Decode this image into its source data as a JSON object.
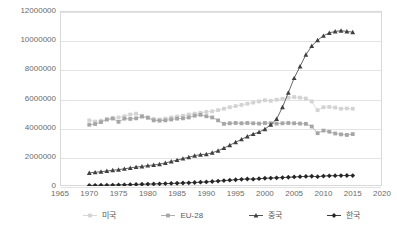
{
  "chart_data": {
    "type": "line",
    "title": "",
    "subtitle": "",
    "xlabel": "",
    "ylabel": "",
    "xlim": [
      1965,
      2020
    ],
    "ylim": [
      0,
      12000000
    ],
    "xticks": [
      1965,
      1970,
      1975,
      1980,
      1985,
      1990,
      1995,
      2000,
      2005,
      2010,
      2015,
      2020
    ],
    "yticks": [
      0,
      2000000,
      4000000,
      6000000,
      8000000,
      10000000,
      12000000
    ],
    "ytick_labels": [
      "0",
      "2000000",
      "4000000",
      "6000000",
      "8000000",
      "10000000",
      "12000000"
    ],
    "grid": "horizontal",
    "legend_position": "bottom",
    "x": [
      1970,
      1971,
      1972,
      1973,
      1974,
      1975,
      1976,
      1977,
      1978,
      1979,
      1980,
      1981,
      1982,
      1983,
      1984,
      1985,
      1986,
      1987,
      1988,
      1989,
      1990,
      1991,
      1992,
      1993,
      1994,
      1995,
      1996,
      1997,
      1998,
      1999,
      2000,
      2001,
      2002,
      2003,
      2004,
      2005,
      2006,
      2007,
      2008,
      2009,
      2010,
      2011,
      2012,
      2013,
      2014,
      2015
    ],
    "series": [
      {
        "name": "미국",
        "marker": "square",
        "color": "#d3d3d3",
        "values": [
          4500000,
          4420000,
          4480000,
          4560000,
          4620000,
          4700000,
          4780000,
          4900000,
          4960000,
          4820000,
          4700000,
          4600000,
          4560000,
          4620000,
          4700000,
          4760000,
          4820000,
          4900000,
          4960000,
          5020000,
          5080000,
          5120000,
          5200000,
          5300000,
          5400000,
          5480000,
          5560000,
          5640000,
          5720000,
          5800000,
          5880000,
          5840000,
          5920000,
          5980000,
          6050000,
          6100000,
          6060000,
          6000000,
          5800000,
          5200000,
          5400000,
          5420000,
          5380000,
          5300000,
          5320000,
          5300000
        ]
      },
      {
        "name": "EU-28",
        "marker": "square",
        "color": "#a6a6a6",
        "values": [
          4200000,
          4250000,
          4380000,
          4560000,
          4640000,
          4400000,
          4620000,
          4600000,
          4640000,
          4760000,
          4680000,
          4500000,
          4480000,
          4500000,
          4560000,
          4620000,
          4640000,
          4700000,
          4820000,
          4880000,
          4780000,
          4700000,
          4500000,
          4260000,
          4300000,
          4320000,
          4300000,
          4320000,
          4300000,
          4280000,
          4320000,
          4300000,
          4280000,
          4300000,
          4320000,
          4300000,
          4280000,
          4260000,
          4080000,
          3620000,
          3800000,
          3720000,
          3600000,
          3540000,
          3500000,
          3560000
        ]
      },
      {
        "name": "중국",
        "marker": "triangle",
        "color": "#404040",
        "values": [
          900000,
          940000,
          980000,
          1030000,
          1080000,
          1120000,
          1180000,
          1240000,
          1300000,
          1340000,
          1400000,
          1440000,
          1500000,
          1580000,
          1680000,
          1780000,
          1880000,
          1980000,
          2080000,
          2150000,
          2180000,
          2280000,
          2420000,
          2600000,
          2800000,
          3000000,
          3200000,
          3400000,
          3560000,
          3700000,
          3900000,
          4200000,
          4600000,
          5400000,
          6400000,
          7400000,
          8200000,
          9000000,
          9600000,
          10000000,
          10300000,
          10500000,
          10600000,
          10650000,
          10600000,
          10550000
        ]
      },
      {
        "name": "한국",
        "marker": "diamond",
        "color": "#262626",
        "values": [
          40000,
          45000,
          50000,
          58000,
          66000,
          74000,
          84000,
          96000,
          110000,
          120000,
          130000,
          140000,
          152000,
          164000,
          178000,
          190000,
          205000,
          220000,
          240000,
          260000,
          280000,
          310000,
          340000,
          370000,
          400000,
          430000,
          460000,
          480000,
          470000,
          500000,
          530000,
          545000,
          560000,
          580000,
          600000,
          620000,
          640000,
          660000,
          670000,
          640000,
          680000,
          700000,
          710000,
          715000,
          720000,
          715000
        ]
      }
    ]
  },
  "legend": {
    "items": [
      {
        "label": "미국",
        "marker": "square",
        "color": "#d3d3d3"
      },
      {
        "label": "EU-28",
        "marker": "square",
        "color": "#a6a6a6"
      },
      {
        "label": "중국",
        "marker": "triangle",
        "color": "#404040"
      },
      {
        "label": "한국",
        "marker": "diamond",
        "color": "#262626"
      }
    ]
  }
}
